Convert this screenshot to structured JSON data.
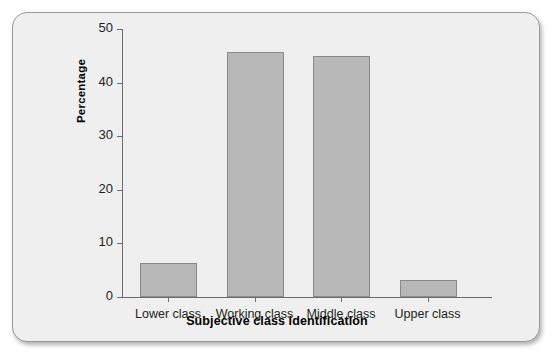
{
  "chart_data": {
    "type": "bar",
    "title": "",
    "xlabel": "Subjective class identification",
    "ylabel": "Percentage",
    "categories": [
      "Lower class",
      "Working class",
      "Middle class",
      "Upper class"
    ],
    "values": [
      6.3,
      45.7,
      45.0,
      3.2
    ],
    "ylim": [
      0,
      50
    ],
    "yticks": [
      0,
      10,
      20,
      30,
      40,
      50
    ],
    "ytick_labels": [
      "0",
      "10",
      "20",
      "30",
      "40",
      "50"
    ],
    "grid": false,
    "legend": null,
    "bar_color": "#b8b8b8",
    "bar_edge_color": "#8a8a8a",
    "axis_color": "#6b6b6b",
    "background_color": "#efefef"
  }
}
